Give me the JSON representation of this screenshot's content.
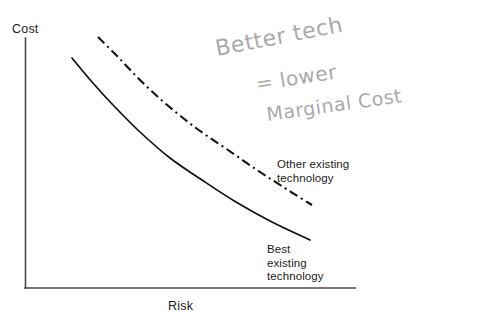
{
  "figure": {
    "background_color": "#ffffff",
    "axis_color": "#4a4a4a",
    "curve_color": "#111111",
    "handwriting_color": "#a9a9ad",
    "label_color": "#1c1c1c"
  },
  "axes": {
    "y_label": "Cost",
    "x_label": "Risk",
    "y_axis": {
      "x": 25,
      "y_top": 38,
      "y_bottom": 288
    },
    "x_axis": {
      "y": 288,
      "x_left": 25,
      "x_right": 355
    }
  },
  "annotations": {
    "handwritten": {
      "line1": "Better tech",
      "line2": "= lower",
      "line3": "Marginal Cost",
      "full_text": "Better tech = lower Marginal Cost"
    },
    "other_existing": "Other existing\ntechnology",
    "best_existing": "Best\nexisting\ntechnology"
  },
  "chart_data": {
    "type": "line",
    "title": "",
    "xlabel": "Risk",
    "ylabel": "Cost",
    "xlim": [
      0,
      100
    ],
    "ylim": [
      0,
      100
    ],
    "grid": false,
    "legend": "inline-annotations",
    "axis_ticks": {
      "x": [],
      "y": []
    },
    "series": [
      {
        "name": "Best existing technology",
        "style": "solid",
        "color": "#111111",
        "annotation": "Best existing technology",
        "points": [
          {
            "x": 72,
            "y": 58
          },
          {
            "x": 92,
            "y": 82
          },
          {
            "x": 114,
            "y": 106
          },
          {
            "x": 140,
            "y": 132
          },
          {
            "x": 170,
            "y": 158
          },
          {
            "x": 202,
            "y": 180
          },
          {
            "x": 236,
            "y": 202
          },
          {
            "x": 272,
            "y": 222
          },
          {
            "x": 310,
            "y": 240
          }
        ]
      },
      {
        "name": "Other existing technology",
        "style": "dash-dot",
        "color": "#111111",
        "annotation": "Other existing technology",
        "points": [
          {
            "x": 98,
            "y": 37
          },
          {
            "x": 118,
            "y": 57
          },
          {
            "x": 140,
            "y": 80
          },
          {
            "x": 166,
            "y": 104
          },
          {
            "x": 196,
            "y": 128
          },
          {
            "x": 228,
            "y": 150
          },
          {
            "x": 260,
            "y": 172
          },
          {
            "x": 288,
            "y": 190
          },
          {
            "x": 312,
            "y": 205
          }
        ]
      }
    ]
  }
}
